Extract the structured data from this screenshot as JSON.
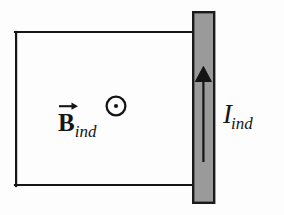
{
  "figure": {
    "background_color": "#fdfdfd",
    "stroke_color": "#151515",
    "bar_fill_color": "#9a9a9a",
    "bar_stroke_color": "#1a1a1a"
  },
  "circuit": {
    "loop": {
      "name": "conducting-loop-rectangle",
      "x": 15,
      "y": 32,
      "width": 180,
      "height": 154,
      "stroke_width": 2.2
    },
    "rail_bar": {
      "name": "sliding-conductor-bar",
      "x": 193,
      "y": 12,
      "width": 21,
      "height": 191,
      "fill": "#9a9a9a",
      "stroke_width": 2.4
    },
    "current_arrow": {
      "name": "induced-current-arrow",
      "direction": "up",
      "tail_y": 162,
      "head_y": 67,
      "x": 203,
      "shaft_width": 2.2,
      "head_width": 17,
      "head_height": 14
    },
    "field_symbol": {
      "name": "field-out-of-page-symbol",
      "glyph": "circle-dot",
      "cx": 116,
      "cy": 106,
      "outer_radius": 10.5,
      "ring_width": 2.2,
      "dot_radius": 2.1
    }
  },
  "labels": {
    "b_field": {
      "name": "magnetic-field-label",
      "base": "B",
      "subscript": "ind",
      "has_vector_arrow": true,
      "full_text": "B_ind"
    },
    "current": {
      "name": "induced-current-label",
      "base": "I",
      "subscript": "ind",
      "has_vector_arrow": false,
      "full_text": "I_ind"
    }
  }
}
